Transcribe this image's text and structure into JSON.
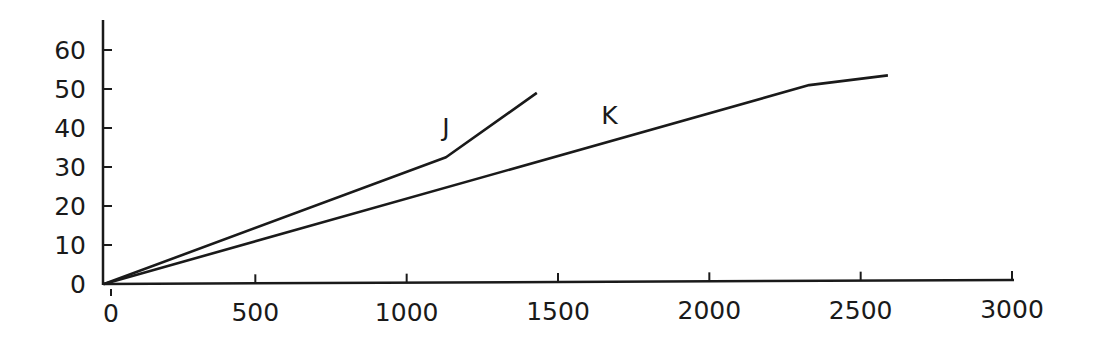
{
  "chart_data": {
    "type": "line",
    "title": "",
    "xlabel": "",
    "ylabel": "",
    "xlim": [
      0,
      3000
    ],
    "ylim": [
      0,
      60
    ],
    "grid": false,
    "legend": "none",
    "x_ticks": [
      0,
      500,
      1000,
      1500,
      2000,
      2500,
      3000
    ],
    "y_ticks": [
      0,
      10,
      20,
      30,
      40,
      50,
      60
    ],
    "x_tick_labels": [
      "0",
      "500",
      "1000",
      "1500",
      "2000",
      "2500",
      "3000"
    ],
    "y_tick_labels": [
      "0",
      "10",
      "20",
      "30",
      "40",
      "50",
      "60"
    ],
    "series": [
      {
        "name": "J",
        "x": [
          0,
          1130,
          1430
        ],
        "y": [
          0,
          32.5,
          49
        ]
      },
      {
        "name": "K",
        "x": [
          0,
          2330,
          2590
        ],
        "y": [
          0,
          51,
          53.5
        ]
      }
    ],
    "annotations": [
      {
        "text": "J",
        "x": 1130,
        "y": 38
      },
      {
        "text": "K",
        "x": 1670,
        "y": 41
      }
    ]
  },
  "style": {
    "line_color": "#1a1a1a",
    "axis_color": "#1a1a1a",
    "background": "#ffffff"
  }
}
